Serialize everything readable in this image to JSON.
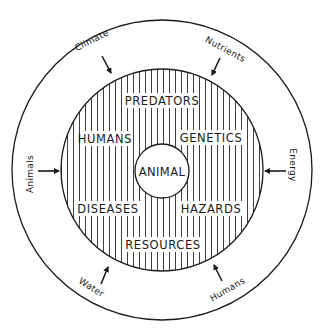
{
  "diagram": {
    "type": "concentric-circles",
    "center": {
      "label": "ANIMAL"
    },
    "middle_ring": {
      "pattern": "vertical-hatching",
      "factors": [
        {
          "id": "predators",
          "label": "PREDATORS"
        },
        {
          "id": "humans",
          "label": "HUMANS"
        },
        {
          "id": "genetics",
          "label": "GENETICS"
        },
        {
          "id": "diseases",
          "label": "DISEASES"
        },
        {
          "id": "hazards",
          "label": "HAZARDS"
        },
        {
          "id": "resources",
          "label": "RESOURCES"
        }
      ]
    },
    "outer_ring": {
      "inputs": [
        {
          "id": "climate",
          "label": "Climate"
        },
        {
          "id": "nutrients",
          "label": "Nutrients"
        },
        {
          "id": "animals",
          "label": "Animals"
        },
        {
          "id": "energy",
          "label": "Energy"
        },
        {
          "id": "water",
          "label": "Water"
        },
        {
          "id": "humans",
          "label": "Humans"
        }
      ]
    },
    "colors": {
      "line": "#1a1a1a",
      "background": "#ffffff"
    }
  }
}
